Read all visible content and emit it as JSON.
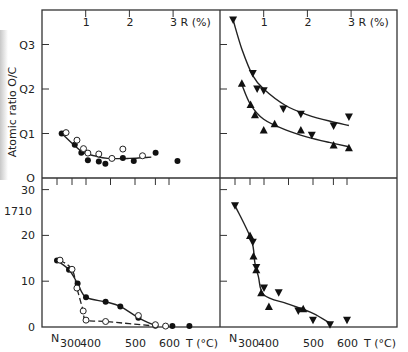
{
  "chart_data": [
    {
      "panel": "top-left",
      "type": "scatter",
      "ylabel": "Atomic ratio  O/C",
      "xlabel": "R (%)",
      "x_axis_position": "top",
      "xlim": [
        0,
        3.5
      ],
      "ylim": [
        0,
        0.35
      ],
      "xticks": [
        "1",
        "2",
        "3 R (%)"
      ],
      "ytick_labels": [
        "0",
        "0.1",
        "0.2",
        "0.3"
      ],
      "ytick_display": [
        "O",
        "Q1",
        "Q2",
        "Q3"
      ],
      "series": [
        {
          "name": "filled circles",
          "marker": "filled-circle",
          "points": [
            [
              0.45,
              0.1
            ],
            [
              0.75,
              0.075
            ],
            [
              0.9,
              0.057
            ],
            [
              1.05,
              0.04
            ],
            [
              1.3,
              0.037
            ],
            [
              1.45,
              0.032
            ],
            [
              1.85,
              0.045
            ],
            [
              2.1,
              0.038
            ],
            [
              2.6,
              0.057
            ],
            [
              3.1,
              0.038
            ]
          ]
        },
        {
          "name": "open circles",
          "marker": "open-circle",
          "points": [
            [
              0.55,
              0.102
            ],
            [
              0.8,
              0.085
            ],
            [
              0.95,
              0.066
            ],
            [
              1.05,
              0.056
            ],
            [
              1.3,
              0.054
            ],
            [
              1.6,
              0.044
            ],
            [
              1.85,
              0.065
            ],
            [
              2.3,
              0.05
            ]
          ]
        }
      ],
      "fit_curve": [
        [
          0.45,
          0.1
        ],
        [
          0.9,
          0.06
        ],
        [
          1.2,
          0.05
        ],
        [
          1.5,
          0.044
        ],
        [
          2.0,
          0.044
        ],
        [
          2.5,
          0.047
        ]
      ]
    },
    {
      "panel": "top-right",
      "type": "scatter",
      "xlabel": "R (%)",
      "x_axis_position": "top",
      "xlim": [
        0,
        3.5
      ],
      "ylim": [
        0,
        0.35
      ],
      "xticks": [
        "1",
        "2",
        "3 R (%)"
      ],
      "series": [
        {
          "name": "down triangles",
          "marker": "triangle-down",
          "points": [
            [
              0.3,
              0.355
            ],
            [
              0.75,
              0.235
            ],
            [
              0.85,
              0.2
            ],
            [
              1.0,
              0.196
            ],
            [
              1.45,
              0.155
            ],
            [
              1.85,
              0.143
            ],
            [
              2.1,
              0.096
            ],
            [
              2.6,
              0.117
            ],
            [
              2.95,
              0.137
            ]
          ]
        },
        {
          "name": "up triangles",
          "marker": "triangle-up",
          "points": [
            [
              0.5,
              0.213
            ],
            [
              0.7,
              0.165
            ],
            [
              0.8,
              0.142
            ],
            [
              1.0,
              0.108
            ],
            [
              1.25,
              0.122
            ],
            [
              1.85,
              0.108
            ],
            [
              2.6,
              0.074
            ],
            [
              2.95,
              0.068
            ]
          ]
        }
      ],
      "fit_curves": [
        [
          [
            0.3,
            0.355
          ],
          [
            0.5,
            0.29
          ],
          [
            0.75,
            0.23
          ],
          [
            1.0,
            0.2
          ],
          [
            1.5,
            0.163
          ],
          [
            2.0,
            0.142
          ],
          [
            2.5,
            0.128
          ],
          [
            2.95,
            0.118
          ]
        ],
        [
          [
            0.5,
            0.21
          ],
          [
            0.7,
            0.165
          ],
          [
            1.0,
            0.132
          ],
          [
            1.5,
            0.108
          ],
          [
            2.0,
            0.092
          ],
          [
            2.5,
            0.08
          ],
          [
            2.95,
            0.07
          ]
        ]
      ]
    },
    {
      "panel": "bottom-left",
      "type": "line",
      "ylabel": "1710",
      "xlabel": "T (°C)",
      "xlim": [
        "N",
        620
      ],
      "ylim": [
        0,
        32
      ],
      "xtick_labels": [
        "N",
        "300",
        "400",
        "500",
        "600",
        "T (°C)"
      ],
      "ytick_labels": [
        "0",
        "10",
        "20",
        "30"
      ],
      "series": [
        {
          "name": "filled circles (solid)",
          "marker": "filled-circle",
          "line": "solid-dash",
          "points": [
            [
              "N",
              14.5
            ],
            [
              290,
              12.5
            ],
            [
              340,
              9.5
            ],
            [
              400,
              6.5
            ],
            [
              440,
              5.5
            ],
            [
              470,
              4.5
            ],
            [
              510,
              2.0
            ],
            [
              560,
              0.3
            ],
            [
              610,
              0.2
            ],
            [
              660,
              0.2
            ]
          ]
        },
        {
          "name": "open circles (dashed)",
          "marker": "open-circle",
          "line": "dashed",
          "points": [
            [
              260,
              14.6
            ],
            [
              300,
              12.6
            ],
            [
              335,
              8.5
            ],
            [
              380,
              3.5
            ],
            [
              400,
              1.5
            ],
            [
              440,
              1.2
            ],
            [
              510,
              2.5
            ],
            [
              560,
              0.5
            ],
            [
              590,
              0.2
            ]
          ]
        }
      ]
    },
    {
      "panel": "bottom-right",
      "type": "line",
      "xlabel": "T (°C)",
      "xlim": [
        "N",
        620
      ],
      "ylim": [
        0,
        32
      ],
      "xtick_labels": [
        "N",
        "300",
        "400",
        "500",
        "600",
        "T (°C)"
      ],
      "series": [
        {
          "name": "down triangles",
          "marker": "triangle-down",
          "points": [
            [
              "N",
              26.5
            ],
            [
              320,
              18.5
            ],
            [
              345,
              13.0
            ],
            [
              400,
              8.5
            ],
            [
              430,
              7.5
            ],
            [
              470,
              3.5
            ],
            [
              500,
              1.5
            ],
            [
              550,
              0.5
            ],
            [
              600,
              1.5
            ]
          ]
        },
        {
          "name": "up triangles",
          "marker": "triangle-up",
          "points": [
            [
              300,
              20.0
            ],
            [
              325,
              15.5
            ],
            [
              345,
              12.5
            ],
            [
              380,
              7.5
            ],
            [
              410,
              4.5
            ],
            [
              480,
              4.0
            ]
          ]
        }
      ]
    }
  ]
}
